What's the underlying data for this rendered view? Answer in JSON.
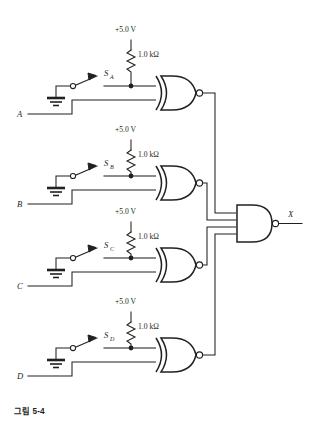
{
  "figure": {
    "caption": "그림 5-4",
    "output_label": "X",
    "supply_label": "+5.0 V",
    "resistor_label": "1.0 kΩ",
    "output_gate": {
      "name": "NAND",
      "inputs": 4,
      "has_output_bubble": true
    },
    "stages": [
      {
        "input_label": "A",
        "switch_label": "S",
        "switch_sub": "A",
        "supply": "+5.0 V",
        "resistor": "1.0 kΩ",
        "gate": "XNOR"
      },
      {
        "input_label": "B",
        "switch_label": "S",
        "switch_sub": "B",
        "supply": "+5.0 V",
        "resistor": "1.0 kΩ",
        "gate": "XNOR"
      },
      {
        "input_label": "C",
        "switch_label": "S",
        "switch_sub": "C",
        "supply": "+5.0 V",
        "resistor": "1.0 kΩ",
        "gate": "XNOR"
      },
      {
        "input_label": "D",
        "switch_label": "S",
        "switch_sub": "D",
        "supply": "+5.0 V",
        "resistor": "1.0 kΩ",
        "gate": "XNOR"
      }
    ],
    "colors": {
      "ink": "#231f20",
      "background": "#ffffff"
    }
  }
}
